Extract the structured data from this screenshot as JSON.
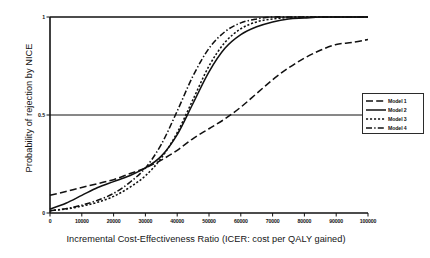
{
  "chart_data": {
    "type": "line",
    "title": "",
    "xlabel": "Incremental Cost-Effectiveness Ratio (ICER: cost per QALY gained)",
    "ylabel": "Probability of rejection by NICE",
    "xlim": [
      0,
      100000
    ],
    "ylim": [
      0,
      1
    ],
    "grid": false,
    "gridlines_y": [
      0.5,
      1
    ],
    "legend_position": "right-outside",
    "xticks": [
      0,
      10000,
      20000,
      30000,
      40000,
      50000,
      60000,
      70000,
      80000,
      90000,
      100000
    ],
    "xtick_labels": [
      "0",
      "10000",
      "20000",
      "30000",
      "40000",
      "50000",
      "60000",
      "70000",
      "80000",
      "90000",
      "100000"
    ],
    "yticks": [
      0,
      0.5,
      1
    ],
    "ytick_labels": [
      "0",
      "0.5",
      "1"
    ],
    "x": [
      0,
      5000,
      10000,
      15000,
      20000,
      25000,
      30000,
      35000,
      40000,
      45000,
      50000,
      55000,
      60000,
      65000,
      70000,
      75000,
      80000,
      85000,
      90000,
      95000,
      100000
    ],
    "series": [
      {
        "name": "Model 1",
        "linestyle": "long-dash",
        "color": "#111111",
        "values": [
          0.09,
          0.11,
          0.13,
          0.15,
          0.17,
          0.2,
          0.23,
          0.27,
          0.32,
          0.38,
          0.43,
          0.48,
          0.54,
          0.61,
          0.68,
          0.74,
          0.79,
          0.83,
          0.86,
          0.87,
          0.885
        ]
      },
      {
        "name": "Model 2",
        "linestyle": "solid",
        "color": "#111111",
        "values": [
          0.02,
          0.05,
          0.09,
          0.13,
          0.16,
          0.19,
          0.23,
          0.29,
          0.4,
          0.56,
          0.72,
          0.84,
          0.91,
          0.95,
          0.975,
          0.99,
          0.995,
          1.0,
          1.0,
          1.0,
          1.0
        ]
      },
      {
        "name": "Model 3",
        "linestyle": "dotted",
        "color": "#111111",
        "values": [
          0.012,
          0.02,
          0.035,
          0.055,
          0.085,
          0.13,
          0.19,
          0.28,
          0.41,
          0.58,
          0.75,
          0.87,
          0.94,
          0.975,
          0.99,
          0.997,
          1.0,
          1.0,
          1.0,
          1.0,
          1.0
        ]
      },
      {
        "name": "Model 4",
        "linestyle": "dash-dot",
        "color": "#111111",
        "values": [
          0.012,
          0.022,
          0.04,
          0.065,
          0.1,
          0.155,
          0.23,
          0.35,
          0.52,
          0.7,
          0.84,
          0.925,
          0.97,
          0.99,
          1.0,
          1.0,
          1.0,
          1.0,
          1.0,
          1.0,
          1.0
        ]
      }
    ]
  },
  "legend": {
    "items": [
      {
        "label": "Model 1"
      },
      {
        "label": "Model 2"
      },
      {
        "label": "Model 3"
      },
      {
        "label": "Model 4"
      }
    ]
  }
}
